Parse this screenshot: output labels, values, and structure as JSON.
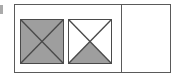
{
  "colors": {
    "tile_fill_gray": "#9e9e9e",
    "tile_fill_white": "#ffffff",
    "tile_border": "#4a4a4a",
    "frame_border": "#5a5a5a",
    "divider": "#5a5a5a",
    "diagonal_stroke": "#4a4a4a",
    "background": "#ffffff",
    "edge_mark": "#8d8d8d"
  },
  "panel": {
    "name": "placeholder-tiles-panel",
    "tile_area": {
      "tiles": [
        {
          "index": 1,
          "icon": "image-placeholder-icon",
          "label": "",
          "fill": "gray",
          "crossed": true,
          "lower_triangle_filled": true,
          "upper_triangle_filled": true
        },
        {
          "index": 2,
          "icon": "image-placeholder-icon",
          "label": "",
          "fill": "white",
          "crossed": true,
          "lower_triangle_filled": true,
          "upper_triangle_filled": false
        }
      ]
    },
    "right_pane": {
      "name": "empty-pane",
      "label": "",
      "content": ""
    }
  },
  "edge_mark": {
    "label": "",
    "icon": "clipped-edge-glyph"
  }
}
